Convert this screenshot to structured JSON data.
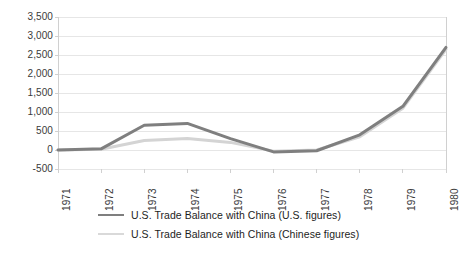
{
  "chart_data": {
    "type": "line",
    "title": "",
    "xlabel": "",
    "ylabel": "",
    "grid": true,
    "legend_position": "bottom",
    "categories": [
      "1971",
      "1972",
      "1973",
      "1974",
      "1975",
      "1976",
      "1977",
      "1978",
      "1979",
      "1980"
    ],
    "ylim": [
      -500,
      3500
    ],
    "ytick_labels": [
      "3,500",
      "3,000",
      "2,500",
      "2,000",
      "1,500",
      "1,000",
      "500",
      "0",
      "-500"
    ],
    "ytick_values": [
      3500,
      3000,
      2500,
      2000,
      1500,
      1000,
      500,
      0,
      -500
    ],
    "series": [
      {
        "name": "U.S. Trade Balance with China (U.S. figures)",
        "color": "#7f7f7f",
        "values": [
          0,
          30,
          650,
          700,
          300,
          -50,
          -20,
          400,
          1150,
          2700
        ]
      },
      {
        "name": "U.S. Trade Balance with China (Chinese figures)",
        "color": "#d4d4d4",
        "values": [
          0,
          20,
          250,
          300,
          200,
          -30,
          0,
          350,
          1100,
          2650
        ]
      }
    ]
  },
  "legend": {
    "items": [
      {
        "label": "U.S. Trade Balance with China (U.S. figures)",
        "color": "#7f7f7f"
      },
      {
        "label": "U.S. Trade Balance with China (Chinese figures)",
        "color": "#d9d9d9"
      }
    ]
  },
  "axes": {
    "y_labels": [
      "3,500",
      "3,000",
      "2,500",
      "2,000",
      "1,500",
      "1,000",
      "500",
      "0",
      "-500"
    ],
    "x_labels": [
      "1971",
      "1972",
      "1973",
      "1974",
      "1975",
      "1976",
      "1977",
      "1978",
      "1979",
      "1980"
    ]
  },
  "style": {
    "grid_color": "#e6e6e6",
    "axis_color": "#d0d0d0",
    "background": "#ffffff",
    "tick_text_color": "#3a3a3a"
  }
}
